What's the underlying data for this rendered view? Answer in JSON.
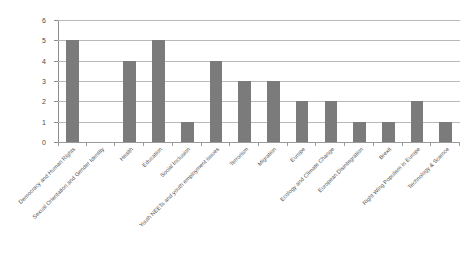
{
  "chart_data": {
    "type": "bar",
    "title": "",
    "subtitle": "",
    "xlabel": "",
    "ylabel": "",
    "ylim": [
      0,
      6
    ],
    "yticks": [
      0,
      1,
      2,
      3,
      4,
      5,
      6
    ],
    "grid": true,
    "legend": false,
    "legend_position": "none",
    "bar_color": "#7b7b7b",
    "gridline_color": "#b9b9b9",
    "axis_color": "#8d8d8d",
    "background_color": "#ffffff",
    "categories": [
      "Democracy and Human Rights",
      "Sexual Orientation and Gender Identity",
      "Health",
      "Education",
      "Social Inclusion",
      "Youth NEETs and youth employment issues",
      "Terrorism",
      "Migration",
      "Europe",
      "Ecology and Climate Change",
      "European Disintegration",
      "Brexit",
      "Right Wing Populism in Europe",
      "Technology & Science"
    ],
    "values": [
      5,
      0,
      4,
      5,
      1,
      4,
      3,
      3,
      2,
      2,
      1,
      1,
      2,
      1
    ]
  }
}
